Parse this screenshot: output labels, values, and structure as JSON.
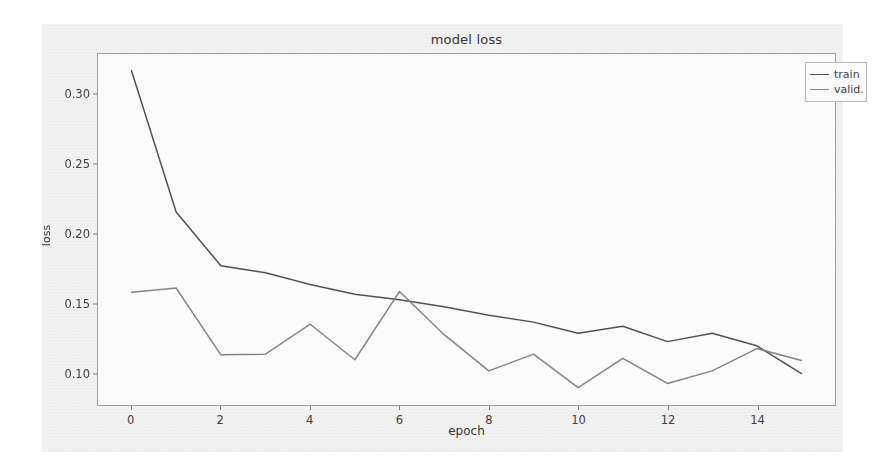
{
  "chart_data": {
    "type": "line",
    "title": "model loss",
    "xlabel": "epoch",
    "ylabel": "loss",
    "x": [
      0,
      1,
      2,
      3,
      4,
      5,
      6,
      7,
      8,
      9,
      10,
      11,
      12,
      13,
      14,
      15
    ],
    "series": [
      {
        "name": "train",
        "color": "#3c3c3c",
        "values": [
          0.317,
          0.2155,
          0.177,
          0.172,
          0.1635,
          0.1565,
          0.1525,
          0.1475,
          0.1415,
          0.1365,
          0.1285,
          0.1335,
          0.1225,
          0.1285,
          0.1195,
          0.0995
        ]
      },
      {
        "name": "valid.",
        "color": "#767676",
        "values": [
          0.158,
          0.161,
          0.113,
          0.1135,
          0.135,
          0.1095,
          0.1585,
          0.1275,
          0.1015,
          0.1135,
          0.0895,
          0.1105,
          0.0925,
          0.1015,
          0.1175,
          0.109
        ]
      }
    ],
    "xlim": [
      -0.75,
      15.75
    ],
    "ylim": [
      0.077,
      0.329
    ],
    "xticks": [
      0,
      2,
      4,
      6,
      8,
      10,
      12,
      14
    ],
    "xtick_labels": [
      "0",
      "2",
      "4",
      "6",
      "8",
      "10",
      "12",
      "14"
    ],
    "yticks": [
      0.1,
      0.15,
      0.2,
      0.25,
      0.3
    ],
    "ytick_labels": [
      "0.10",
      "0.15",
      "0.20",
      "0.25",
      "0.30"
    ],
    "grid": false,
    "legend_position": "upper right",
    "legend_entries": [
      "train",
      "valid."
    ]
  },
  "figure": {
    "background_color": "#f2f2f2",
    "axes_background_color": "#fbfbfb",
    "axes_edge_color": "#9a9a9a"
  }
}
